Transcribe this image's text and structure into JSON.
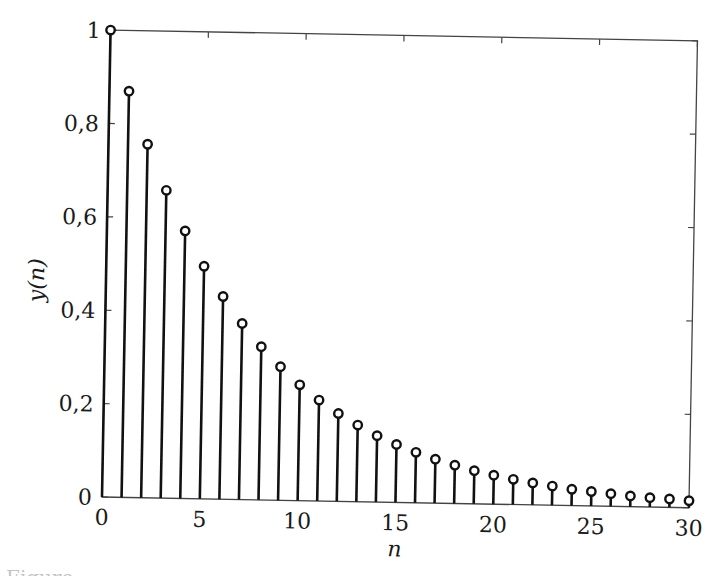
{
  "chart_data": {
    "type": "stem",
    "title": "",
    "xlabel": "n",
    "ylabel": "y(n)",
    "xlim": [
      0,
      30
    ],
    "ylim": [
      0,
      1
    ],
    "x_ticks": [
      0,
      5,
      10,
      15,
      20,
      25,
      30
    ],
    "x_tick_labels": [
      "0",
      "5",
      "10",
      "15",
      "20",
      "25",
      "30"
    ],
    "y_ticks": [
      0,
      0.2,
      0.4,
      0.6,
      0.8,
      1
    ],
    "y_tick_labels": [
      "0",
      "0,2",
      "0,4",
      "0,6",
      "0,8",
      "1"
    ],
    "grid": false,
    "box": true,
    "marker": "open-circle",
    "line_color": "#111111",
    "x": [
      0,
      1,
      2,
      3,
      4,
      5,
      6,
      7,
      8,
      9,
      10,
      11,
      12,
      13,
      14,
      15,
      16,
      17,
      18,
      19,
      20,
      21,
      22,
      23,
      24,
      25,
      26,
      27,
      28,
      29,
      30
    ],
    "values": [
      1.0,
      0.87,
      0.757,
      0.659,
      0.573,
      0.498,
      0.434,
      0.377,
      0.328,
      0.286,
      0.248,
      0.216,
      0.188,
      0.164,
      0.142,
      0.124,
      0.108,
      0.094,
      0.082,
      0.071,
      0.062,
      0.054,
      0.047,
      0.041,
      0.035,
      0.031,
      0.027,
      0.023,
      0.02,
      0.018,
      0.015
    ]
  },
  "caption": "Figure"
}
